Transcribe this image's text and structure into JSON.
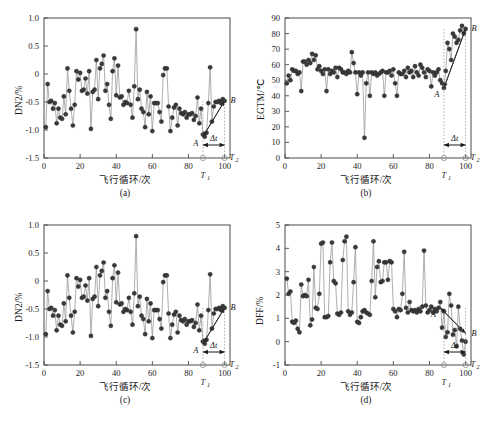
{
  "figure": {
    "caption": "",
    "panels": [
      {
        "tag": "(a)",
        "key": "a"
      },
      {
        "tag": "(b)",
        "key": "b"
      },
      {
        "tag": "(c)",
        "key": "c"
      },
      {
        "tag": "(d)",
        "key": "d"
      }
    ],
    "annotation_labels": {
      "point_a": "A",
      "point_b": "B",
      "delta_t": "Δt",
      "t1": "T",
      "t1_sub": "1",
      "t2": "T",
      "t2_sub": "2"
    }
  },
  "chart_data": [
    {
      "type": "line",
      "panel": "(a)",
      "title": "",
      "xlabel": "飞行循环/次",
      "ylabel": "DN2/%",
      "xlim": [
        0,
        103
      ],
      "ylim": [
        -1.5,
        1.0
      ],
      "xticks": [
        0,
        20,
        40,
        60,
        80,
        100
      ],
      "yticks": [
        -1.5,
        -1.0,
        -0.5,
        0,
        0.5,
        1.0
      ],
      "ytick_labels": [
        "-1.5",
        "-1.0",
        "-0.5",
        "0",
        "0.5",
        "1.0"
      ],
      "grid": false,
      "legend": "none",
      "marker": "filled-circle",
      "x": [
        1,
        2,
        3,
        4,
        5,
        6,
        7,
        8,
        9,
        10,
        11,
        12,
        13,
        14,
        15,
        16,
        17,
        18,
        19,
        20,
        21,
        22,
        23,
        24,
        25,
        26,
        27,
        28,
        29,
        30,
        31,
        32,
        33,
        34,
        35,
        36,
        37,
        38,
        39,
        40,
        41,
        42,
        43,
        44,
        45,
        46,
        47,
        48,
        49,
        50,
        51,
        52,
        53,
        54,
        55,
        56,
        57,
        58,
        59,
        60,
        61,
        62,
        63,
        64,
        65,
        66,
        67,
        68,
        69,
        70,
        71,
        72,
        73,
        74,
        75,
        76,
        77,
        78,
        79,
        80,
        81,
        82,
        83,
        84,
        85,
        86,
        87,
        88,
        89,
        90,
        91,
        92,
        93,
        94,
        95,
        96,
        97,
        98,
        99,
        100
      ],
      "values": [
        -0.95,
        -0.18,
        -0.5,
        -0.48,
        -0.62,
        -0.52,
        -0.88,
        -0.62,
        -0.78,
        -0.8,
        -0.4,
        -0.72,
        0.1,
        -0.3,
        -0.62,
        -0.92,
        -0.55,
        0.05,
        -0.1,
        0.02,
        -0.3,
        -0.28,
        -0.08,
        -0.35,
        0.05,
        -0.98,
        -0.32,
        -0.28,
        0.25,
        -0.45,
        0.1,
        0.18,
        0.33,
        -0.3,
        -0.18,
        -0.55,
        -0.8,
        0.05,
        0.28,
        -0.38,
        0.15,
        -0.42,
        -0.4,
        -0.55,
        -0.5,
        -0.52,
        -0.3,
        -0.55,
        -0.78,
        -0.22,
        0.8,
        -0.45,
        -0.28,
        -0.62,
        -0.68,
        -0.95,
        -0.32,
        -0.72,
        -0.4,
        -1.02,
        -0.52,
        -0.52,
        -0.52,
        -0.68,
        -0.85,
        -0.02,
        0.1,
        0.1,
        -0.58,
        -1.02,
        -0.78,
        -0.6,
        -0.55,
        -0.92,
        -0.62,
        -0.7,
        -0.72,
        -0.68,
        -0.78,
        -0.72,
        -0.72,
        -0.7,
        -0.82,
        -0.75,
        -0.42,
        -0.88,
        -0.62,
        -1.08,
        -1.12,
        -1.05,
        -0.52,
        0.12,
        -0.85,
        -0.58,
        -0.5,
        -0.5,
        -0.48,
        -0.52,
        -0.45,
        -0.48
      ],
      "markers": {
        "A": {
          "x": 88,
          "y": -1.12
        },
        "B": {
          "x": 100,
          "y": -0.48
        }
      },
      "trend_direction": "up",
      "t1": 88,
      "t2": 100
    },
    {
      "type": "line",
      "panel": "(b)",
      "title": "",
      "xlabel": "飞行循环/次",
      "ylabel": "EGTM/℃",
      "xlim": [
        0,
        103
      ],
      "ylim": [
        0,
        90
      ],
      "xticks": [
        0,
        20,
        40,
        60,
        80,
        100
      ],
      "yticks": [
        0,
        10,
        20,
        30,
        40,
        50,
        60,
        70,
        80,
        90
      ],
      "ytick_labels": [
        "0",
        "10",
        "20",
        "30",
        "40",
        "50",
        "60",
        "70",
        "80",
        "90"
      ],
      "grid": false,
      "legend": "none",
      "marker": "filled-circle",
      "x": [
        1,
        2,
        3,
        4,
        5,
        6,
        7,
        8,
        9,
        10,
        11,
        12,
        13,
        14,
        15,
        16,
        17,
        18,
        19,
        20,
        21,
        22,
        23,
        24,
        25,
        26,
        27,
        28,
        29,
        30,
        31,
        32,
        33,
        34,
        35,
        36,
        37,
        38,
        39,
        40,
        41,
        42,
        43,
        44,
        45,
        46,
        47,
        48,
        49,
        50,
        51,
        52,
        53,
        54,
        55,
        56,
        57,
        58,
        59,
        60,
        61,
        62,
        63,
        64,
        65,
        66,
        67,
        68,
        69,
        70,
        71,
        72,
        73,
        74,
        75,
        76,
        77,
        78,
        79,
        80,
        81,
        82,
        83,
        84,
        85,
        86,
        87,
        88,
        89,
        90,
        91,
        92,
        93,
        94,
        95,
        96,
        97,
        98,
        99,
        100
      ],
      "values": [
        48,
        53,
        50,
        57,
        56,
        56,
        54,
        55,
        43,
        62,
        62,
        60,
        63,
        61,
        67,
        63,
        66,
        57,
        59,
        56,
        54,
        57,
        43,
        57,
        54,
        56,
        55,
        58,
        52,
        58,
        57,
        55,
        55,
        54,
        56,
        55,
        68,
        61,
        55,
        41,
        55,
        53,
        55,
        13,
        48,
        55,
        40,
        55,
        54,
        55,
        53,
        54,
        55,
        56,
        40,
        55,
        55,
        56,
        53,
        57,
        48,
        40,
        55,
        54,
        54,
        56,
        52,
        58,
        55,
        56,
        52,
        59,
        55,
        53,
        60,
        58,
        55,
        52,
        57,
        56,
        46,
        55,
        53,
        55,
        57,
        50,
        48,
        45,
        56,
        74,
        70,
        63,
        80,
        78,
        74,
        76,
        82,
        85,
        80,
        83
      ],
      "markers": {
        "A": {
          "x": 88,
          "y": 45
        },
        "B": {
          "x": 100,
          "y": 83
        }
      },
      "trend_direction": "up",
      "t1": 88,
      "t2": 100
    },
    {
      "type": "line",
      "panel": "(c)",
      "title": "",
      "xlabel": "飞行循环/次",
      "ylabel": "DN2/%",
      "xlim": [
        0,
        103
      ],
      "ylim": [
        -1.5,
        1.0
      ],
      "xticks": [
        0,
        20,
        40,
        60,
        80,
        100
      ],
      "yticks": [
        -1.5,
        -1.0,
        -0.5,
        0,
        0.5,
        1.0
      ],
      "ytick_labels": [
        "-1.5",
        "-1.0",
        "-0.5",
        "0",
        "0.5",
        "1.0"
      ],
      "grid": false,
      "legend": "none",
      "marker": "filled-circle",
      "x": [
        1,
        2,
        3,
        4,
        5,
        6,
        7,
        8,
        9,
        10,
        11,
        12,
        13,
        14,
        15,
        16,
        17,
        18,
        19,
        20,
        21,
        22,
        23,
        24,
        25,
        26,
        27,
        28,
        29,
        30,
        31,
        32,
        33,
        34,
        35,
        36,
        37,
        38,
        39,
        40,
        41,
        42,
        43,
        44,
        45,
        46,
        47,
        48,
        49,
        50,
        51,
        52,
        53,
        54,
        55,
        56,
        57,
        58,
        59,
        60,
        61,
        62,
        63,
        64,
        65,
        66,
        67,
        68,
        69,
        70,
        71,
        72,
        73,
        74,
        75,
        76,
        77,
        78,
        79,
        80,
        81,
        82,
        83,
        84,
        85,
        86,
        87,
        88,
        89,
        90,
        91,
        92,
        93,
        94,
        95,
        96,
        97,
        98,
        99,
        100
      ],
      "values": [
        -0.95,
        -0.18,
        -0.5,
        -0.48,
        -0.62,
        -0.52,
        -0.88,
        -0.62,
        -0.78,
        -0.8,
        -0.4,
        -0.72,
        0.1,
        -0.3,
        -0.62,
        -0.92,
        -0.55,
        0.05,
        -0.1,
        0.02,
        -0.3,
        -0.28,
        -0.08,
        -0.35,
        0.05,
        -0.98,
        -0.32,
        -0.28,
        0.25,
        -0.45,
        0.1,
        0.18,
        0.33,
        -0.3,
        -0.18,
        -0.55,
        -0.8,
        0.05,
        0.28,
        -0.38,
        0.15,
        -0.42,
        -0.4,
        -0.55,
        -0.5,
        -0.52,
        -0.3,
        -0.55,
        -0.78,
        -0.22,
        0.8,
        -0.45,
        -0.28,
        -0.62,
        -0.68,
        -0.95,
        -0.32,
        -0.72,
        -0.4,
        -1.02,
        -0.52,
        -0.52,
        -0.52,
        -0.68,
        -0.85,
        -0.02,
        0.1,
        0.1,
        -0.58,
        -1.02,
        -0.78,
        -0.6,
        -0.55,
        -0.92,
        -0.62,
        -0.7,
        -0.72,
        -0.68,
        -0.78,
        -0.72,
        -0.72,
        -0.7,
        -0.82,
        -0.75,
        -0.42,
        -0.88,
        -0.62,
        -1.08,
        -1.12,
        -1.05,
        -0.52,
        0.12,
        -0.85,
        -0.58,
        -0.5,
        -0.5,
        -0.48,
        -0.52,
        -0.45,
        -0.48
      ],
      "markers": {
        "A": {
          "x": 88,
          "y": -1.12
        },
        "B": {
          "x": 100,
          "y": -0.48
        }
      },
      "trend_direction": "up",
      "t1": 88,
      "t2": 100
    },
    {
      "type": "line",
      "panel": "(d)",
      "title": "",
      "xlabel": "飞行循环/次",
      "ylabel": "DFF/%",
      "xlim": [
        0,
        103
      ],
      "ylim": [
        -1,
        5
      ],
      "xticks": [
        0,
        20,
        40,
        60,
        80,
        100
      ],
      "yticks": [
        -1,
        0,
        1,
        2,
        3,
        4,
        5
      ],
      "ytick_labels": [
        "-1",
        "0",
        "1",
        "2",
        "3",
        "4",
        "5"
      ],
      "grid": false,
      "legend": "none",
      "marker": "filled-circle",
      "x": [
        1,
        2,
        3,
        4,
        5,
        6,
        7,
        8,
        9,
        10,
        11,
        12,
        13,
        14,
        15,
        16,
        17,
        18,
        19,
        20,
        21,
        22,
        23,
        24,
        25,
        26,
        27,
        28,
        29,
        30,
        31,
        32,
        33,
        34,
        35,
        36,
        37,
        38,
        39,
        40,
        41,
        42,
        43,
        44,
        45,
        46,
        47,
        48,
        49,
        50,
        51,
        52,
        53,
        54,
        55,
        56,
        57,
        58,
        59,
        60,
        61,
        62,
        63,
        64,
        65,
        66,
        67,
        68,
        69,
        70,
        71,
        72,
        73,
        74,
        75,
        76,
        77,
        78,
        79,
        80,
        81,
        82,
        83,
        84,
        85,
        86,
        87,
        88,
        89,
        90,
        91,
        92,
        93,
        94,
        95,
        96,
        97,
        98,
        99,
        100
      ],
      "values": [
        2.7,
        2.05,
        2.15,
        0.85,
        0.8,
        0.9,
        0.55,
        0.4,
        2.45,
        1.95,
        2.0,
        1.95,
        2.65,
        0.7,
        0.95,
        3.2,
        1.45,
        1.4,
        2.05,
        4.2,
        4.25,
        1.05,
        1.05,
        1.1,
        3.4,
        4.25,
        2.6,
        2.5,
        1.2,
        1.15,
        1.25,
        3.5,
        4.3,
        4.5,
        1.3,
        1.15,
        1.25,
        2.55,
        4.05,
        0.85,
        0.8,
        1.05,
        1.3,
        1.35,
        1.25,
        1.2,
        1.15,
        2.6,
        4.3,
        1.9,
        3.2,
        3.45,
        2.55,
        2.6,
        3.4,
        3.4,
        2.65,
        3.45,
        3.4,
        1.4,
        1.3,
        1.05,
        1.4,
        1.35,
        2.05,
        3.85,
        1.45,
        1.25,
        1.7,
        1.35,
        1.3,
        1.35,
        1.25,
        1.4,
        1.3,
        1.5,
        3.9,
        1.55,
        1.25,
        1.35,
        1.5,
        1.25,
        1.4,
        1.3,
        1.45,
        1.7,
        0.6,
        1.3,
        0.2,
        0.4,
        2.05,
        1.55,
        0.3,
        0.5,
        -0.2,
        1.5,
        0.55,
        0.05,
        -0.55,
        0.0
      ],
      "markers": {
        "A": {
          "x": 86,
          "y": 1.45
        },
        "B": {
          "x": 100,
          "y": 0.35
        }
      },
      "trend_direction": "down",
      "t1": 88,
      "t2": 100
    }
  ]
}
